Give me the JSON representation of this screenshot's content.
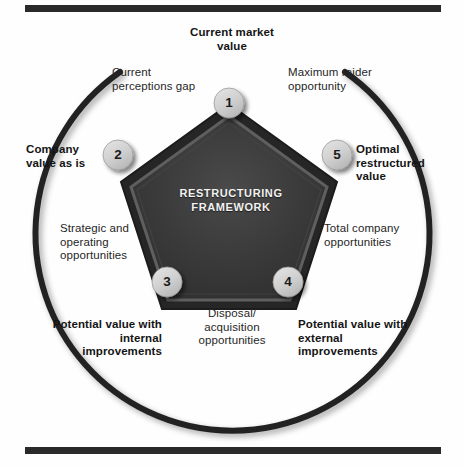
{
  "figure": {
    "center_title_line1": "RESTRUCTURING",
    "center_title_line2": "FRAMEWORK",
    "accent_dark": "#2a2a2a",
    "pentagon_fill": "#3b3b3b",
    "pentagon_edge": "#6b6b6b",
    "node_fill": "#d4d4d4",
    "arc_color": "#232323"
  },
  "nodes": [
    {
      "id": 1,
      "number": "1",
      "bold_label": "Current\nmarket\nvalue"
    },
    {
      "id": 2,
      "number": "2",
      "bold_label": "Company\nvalue\nas is"
    },
    {
      "id": 3,
      "number": "3",
      "bold_label": "Potential value\nwith internal\nimprovements"
    },
    {
      "id": 4,
      "number": "4",
      "bold_label": "Potential value\nwith external\nimprovements"
    },
    {
      "id": 5,
      "number": "5",
      "bold_label": "Optimal\nrestructured\nvalue"
    }
  ],
  "bold_labels": {
    "current_market_value": "Current market value",
    "company_value_as_is": "Company value as is",
    "optimal_restructured_value": "Optimal restructured value",
    "potential_value_internal": "Potential value with internal improvements",
    "potential_value_external": "Potential value with external improvements"
  },
  "gap_labels": {
    "current_perceptions_gap": "Current perceptions gap",
    "maximum_raider_opportunity": "Maximum raider opportunity",
    "strategic_operating_opportunities": "Strategic and operating opportunities",
    "total_company_opportunities": "Total company opportunities",
    "disposal_acquisition_opportunities": "Disposal/ acquisition opportunities"
  },
  "node_numbers": {
    "n1": "1",
    "n2": "2",
    "n3": "3",
    "n4": "4",
    "n5": "5"
  }
}
